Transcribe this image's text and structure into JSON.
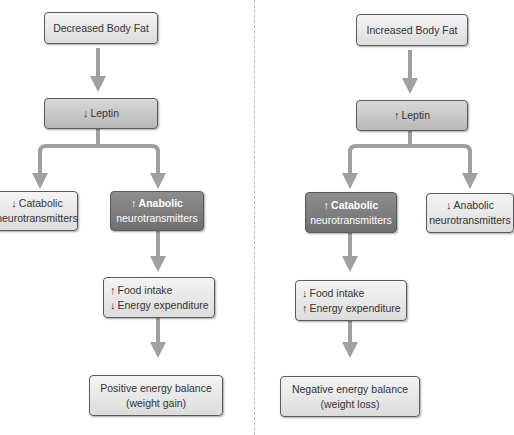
{
  "left": {
    "start": "Decreased Body Fat",
    "leptin": {
      "arrow": "↓",
      "label": "Leptin"
    },
    "branch_a": {
      "arrow": "↓",
      "line1": "Catabolic",
      "line2": "neurotransmitters"
    },
    "branch_b": {
      "arrow": "↑",
      "line1": "Anabolic",
      "line2": "neurotransmitters"
    },
    "intake": {
      "a1": "↑",
      "l1": "Food intake",
      "a2": "↓",
      "l2": "Energy expenditure"
    },
    "result": {
      "line1": "Positive energy balance",
      "line2": "(weight gain)"
    }
  },
  "right": {
    "start": "Increased Body Fat",
    "leptin": {
      "arrow": "↑",
      "label": "Leptin"
    },
    "branch_a": {
      "arrow": "↑",
      "line1": "Catabolic",
      "line2": "neurotransmitters"
    },
    "branch_b": {
      "arrow": "↓",
      "line1": "Anabolic",
      "line2": "neurotransmitters"
    },
    "intake": {
      "a1": "↓",
      "l1": "Food intake",
      "a2": "↑",
      "l2": "Energy expenditure"
    },
    "result": {
      "line1": "Negative energy balance",
      "line2": "(weight loss)"
    }
  },
  "colors": {
    "arrow": "#a0a0a0",
    "dark_box": "#7a7a7a",
    "light_box": "#e8e8e8"
  }
}
